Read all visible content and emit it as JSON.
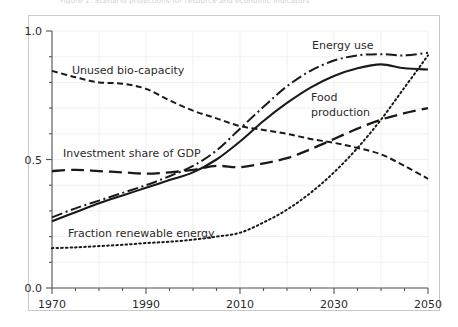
{
  "figure": {
    "clipped_caption_top": "Figure 1. Scenario projections for resource and economic indicators",
    "border_color": "#c9c9c9",
    "background_color": "#ffffff",
    "grid_color": "#f0f0f0",
    "line_color": "#1a1a1a"
  },
  "axes": {
    "x_ticks": [
      "1970",
      "1990",
      "2010",
      "2030",
      "2050"
    ],
    "x_tick_values": [
      1970,
      1990,
      2010,
      2030,
      2050
    ],
    "x_minor_step": 5,
    "y_ticks": [
      "0.0",
      "0.5",
      "1.0"
    ],
    "y_tick_values": [
      0.0,
      0.5,
      1.0
    ],
    "y_minor_step": 0.1,
    "xlim": [
      1970,
      2050
    ],
    "ylim": [
      0.0,
      1.0
    ]
  },
  "labels": {
    "unused_bio_capacity": "Unused bio-capacity",
    "investment_share_of_gdp": "Investment share of GDP",
    "fraction_renewable_energy": "Fraction renewable energy",
    "energy_use": "Energy use",
    "food_production_line1": "Food",
    "food_production_line2": "production"
  },
  "chart_data": {
    "type": "line",
    "title": "",
    "xlabel": "",
    "ylabel": "",
    "xlim": [
      1970,
      2050
    ],
    "ylim": [
      0.0,
      1.0
    ],
    "grid": true,
    "legend_position": "inline-annotations",
    "x": [
      1970,
      1975,
      1980,
      1985,
      1990,
      1995,
      2000,
      2005,
      2010,
      2015,
      2020,
      2025,
      2030,
      2035,
      2040,
      2045,
      2050
    ],
    "series": [
      {
        "name": "Unused bio-capacity",
        "style": "short-dashed",
        "label_text": "Unused bio-capacity",
        "values": [
          0.845,
          0.82,
          0.8,
          0.795,
          0.775,
          0.73,
          0.69,
          0.66,
          0.63,
          0.615,
          0.6,
          0.58,
          0.565,
          0.545,
          0.52,
          0.475,
          0.425
        ]
      },
      {
        "name": "Investment share of GDP",
        "style": "long-dashed",
        "label_text": "Investment share of GDP",
        "values": [
          0.455,
          0.46,
          0.455,
          0.45,
          0.445,
          0.45,
          0.46,
          0.475,
          0.47,
          0.485,
          0.505,
          0.54,
          0.58,
          0.62,
          0.655,
          0.68,
          0.7
        ]
      },
      {
        "name": "Fraction renewable energy",
        "style": "dotted",
        "label_text": "Fraction renewable energy",
        "values": [
          0.155,
          0.158,
          0.163,
          0.168,
          0.175,
          0.18,
          0.188,
          0.2,
          0.215,
          0.255,
          0.305,
          0.37,
          0.45,
          0.545,
          0.655,
          0.78,
          0.905
        ]
      },
      {
        "name": "Energy use",
        "style": "dash-dot",
        "label_text": "Energy use",
        "values": [
          0.275,
          0.31,
          0.34,
          0.37,
          0.4,
          0.435,
          0.475,
          0.535,
          0.62,
          0.705,
          0.785,
          0.845,
          0.885,
          0.905,
          0.91,
          0.905,
          0.915
        ]
      },
      {
        "name": "Food production",
        "style": "solid",
        "label_text": "Food production",
        "values": [
          0.26,
          0.295,
          0.33,
          0.36,
          0.39,
          0.42,
          0.45,
          0.5,
          0.57,
          0.65,
          0.72,
          0.78,
          0.825,
          0.855,
          0.87,
          0.855,
          0.85
        ]
      }
    ]
  }
}
